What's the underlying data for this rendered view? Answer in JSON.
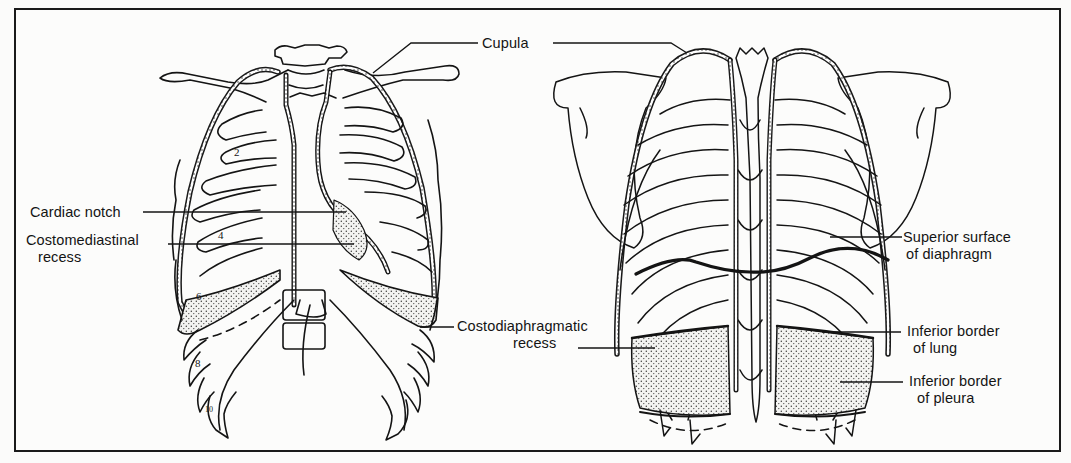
{
  "figure": {
    "views": [
      {
        "id": "anterior",
        "name": "Anterior view of thorax (lungs and pleura)"
      },
      {
        "id": "posterior",
        "name": "Posterior view of thorax (lungs and pleura)"
      }
    ],
    "labels": {
      "cupula": "Cupula",
      "cardiac_notch": "Cardiac notch",
      "costomediastinal_line1": "Costomediastinal",
      "costomediastinal_line2": "recess",
      "costodiaphragmatic_line1": "Costodiaphragmatic",
      "costodiaphragmatic_line2": "recess",
      "superior_surface_line1": "Superior surface",
      "superior_surface_line2": "of diaphragm",
      "inferior_lung_line1": "Inferior border",
      "inferior_lung_line2": "of lung",
      "inferior_pleura_line1": "Inferior border",
      "inferior_pleura_line2": "of pleura"
    },
    "rib_numbers": [
      "2",
      "4",
      "6",
      "8",
      "10"
    ],
    "colors": {
      "ink": "#141414",
      "paper": "#fbfbfa",
      "stipple": "#3a3a3a"
    }
  }
}
